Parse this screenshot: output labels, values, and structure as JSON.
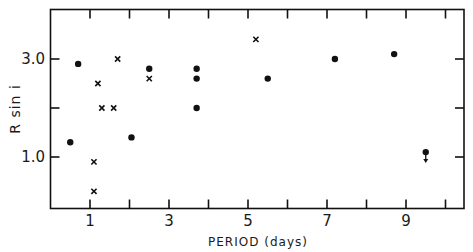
{
  "chart_data": {
    "type": "scatter",
    "title": "",
    "xlabel": "PERIOD (days)",
    "ylabel": "R sin i",
    "xlim": [
      0,
      10.4
    ],
    "ylim": [
      0,
      4.0
    ],
    "x_ticks": [
      1,
      2,
      3,
      4,
      5,
      6,
      7,
      8,
      9,
      10
    ],
    "x_tick_labels": [
      "1",
      "3",
      "5",
      "7",
      "9"
    ],
    "x_tick_label_values": [
      1,
      3,
      5,
      7,
      9
    ],
    "y_ticks": [
      1.0,
      2.0,
      3.0
    ],
    "y_tick_labels": [
      "1.0",
      "3.0"
    ],
    "y_tick_label_values": [
      1.0,
      3.0
    ],
    "grid": false,
    "legend": null,
    "series": [
      {
        "name": "dots",
        "marker": "filled-circle",
        "points": [
          {
            "x": 0.5,
            "y": 1.3
          },
          {
            "x": 0.7,
            "y": 2.9
          },
          {
            "x": 2.05,
            "y": 1.4
          },
          {
            "x": 2.5,
            "y": 2.8
          },
          {
            "x": 3.7,
            "y": 2.8
          },
          {
            "x": 3.7,
            "y": 2.6
          },
          {
            "x": 3.7,
            "y": 2.0
          },
          {
            "x": 5.5,
            "y": 2.6
          },
          {
            "x": 7.2,
            "y": 3.0
          },
          {
            "x": 8.7,
            "y": 3.1
          },
          {
            "x": 9.5,
            "y": 1.1,
            "upper_limit": true
          }
        ]
      },
      {
        "name": "crosses",
        "marker": "x",
        "points": [
          {
            "x": 1.1,
            "y": 0.9
          },
          {
            "x": 1.1,
            "y": 0.3
          },
          {
            "x": 1.2,
            "y": 2.5
          },
          {
            "x": 1.3,
            "y": 2.0
          },
          {
            "x": 1.6,
            "y": 2.0
          },
          {
            "x": 1.7,
            "y": 3.0
          },
          {
            "x": 2.5,
            "y": 2.6
          },
          {
            "x": 5.2,
            "y": 3.4
          }
        ]
      }
    ]
  },
  "labels": {
    "xlabel": "PERIOD (days)",
    "ylabel": "R sin i"
  },
  "colors": {
    "ink": "#111111",
    "background": "#ffffff"
  }
}
